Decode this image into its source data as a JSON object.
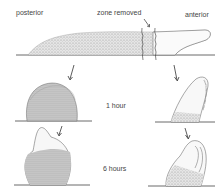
{
  "diagram": {
    "labels": {
      "posterior": "posterior",
      "zone_removed": "zone removed",
      "anterior": "anterior",
      "time_1": "1 hour",
      "time_2": "6 hours"
    },
    "stages": [
      {
        "name": "initial",
        "description": "elongated organism with zone removed between posterior and anterior"
      },
      {
        "name": "1 hour",
        "posterior_fragment": "rounded dome",
        "anterior_fragment": "tilted finger"
      },
      {
        "name": "6 hours",
        "posterior_fragment": "dome with apical protrusion",
        "anterior_fragment": "lobed protrusion"
      }
    ],
    "colors": {
      "ink": "#333333",
      "stipple": "#888888",
      "background": "#ffffff"
    }
  }
}
